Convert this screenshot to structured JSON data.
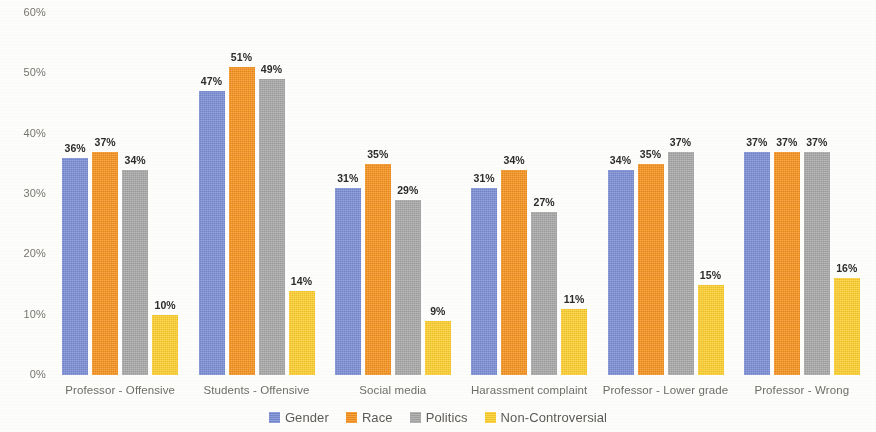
{
  "chart_data": {
    "type": "bar",
    "title": "",
    "subtitle": "",
    "xlabel": "",
    "ylabel": "",
    "ylim": [
      0,
      60
    ],
    "grid": false,
    "legend_position": "bottom",
    "y_ticks": [
      "0%",
      "10%",
      "20%",
      "30%",
      "40%",
      "50%",
      "60%"
    ],
    "y_tick_values": [
      0,
      10,
      20,
      30,
      40,
      50,
      60
    ],
    "categories": [
      "Professor - Offensive",
      "Students - Offensive",
      "Social media",
      "Harassment complaint",
      "Professor - Lower grade",
      "Professor - Wrong"
    ],
    "series": [
      {
        "name": "Gender",
        "color": "#7b8ed6",
        "values": [
          36,
          47,
          31,
          31,
          34,
          37
        ],
        "labels": [
          "36%",
          "47%",
          "31%",
          "31%",
          "34%",
          "37%"
        ]
      },
      {
        "name": "Race",
        "color": "#f7931e",
        "values": [
          37,
          51,
          35,
          34,
          35,
          37
        ],
        "labels": [
          "37%",
          "51%",
          "35%",
          "34%",
          "35%",
          "37%"
        ]
      },
      {
        "name": "Politics",
        "color": "#a8a8a8",
        "values": [
          34,
          49,
          29,
          27,
          37,
          37
        ],
        "labels": [
          "34%",
          "49%",
          "29%",
          "27%",
          "37%",
          "37%"
        ]
      },
      {
        "name": "Non-Controversial",
        "color": "#ffd02e",
        "values": [
          10,
          14,
          9,
          11,
          15,
          16
        ],
        "labels": [
          "10%",
          "14%",
          "9%",
          "11%",
          "15%",
          "16%"
        ]
      }
    ]
  }
}
